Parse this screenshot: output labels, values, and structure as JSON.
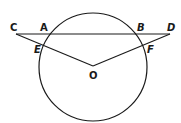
{
  "diagram": {
    "type": "geometry",
    "circle": {
      "center_label": "O",
      "cx": 93,
      "cy": 67,
      "r": 54
    },
    "points": {
      "C": {
        "label": "C",
        "x": 16,
        "y": 34
      },
      "A": {
        "label": "A",
        "x": 46,
        "y": 34
      },
      "B": {
        "label": "B",
        "x": 140,
        "y": 34
      },
      "D": {
        "label": "D",
        "x": 170,
        "y": 34
      },
      "E": {
        "label": "E",
        "x": 42,
        "y": 46
      },
      "F": {
        "label": "F",
        "x": 145,
        "y": 46
      },
      "O": {
        "label": "O",
        "x": 93,
        "y": 66
      }
    },
    "segments": [
      {
        "from": "C",
        "to": "D"
      },
      {
        "from": "C",
        "to": "O"
      },
      {
        "from": "D",
        "to": "O"
      }
    ],
    "stroke_color": "#1a1a1a",
    "background_color": "#ffffff"
  }
}
